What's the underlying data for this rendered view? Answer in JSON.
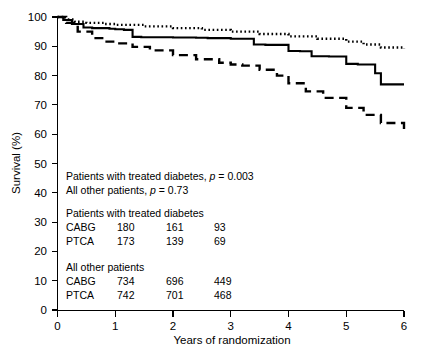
{
  "chart_data": {
    "type": "line",
    "title": "",
    "xlabel": "Years of randomization",
    "ylabel": "Survival (%)",
    "xlim": [
      0,
      6
    ],
    "ylim": [
      0,
      100
    ],
    "grid": false,
    "legend_position": "none",
    "xticks": [
      "0",
      "1",
      "2",
      "3",
      "4",
      "5",
      "6"
    ],
    "yticks": [
      "0",
      "10",
      "20",
      "30",
      "40",
      "50",
      "60",
      "70",
      "80",
      "90",
      "100"
    ],
    "series": [
      {
        "name": "All other patients, CABG",
        "style": "dotted",
        "x": [
          0,
          0.12,
          0.3,
          0.5,
          0.8,
          1.0,
          1.5,
          2.0,
          2.5,
          3.0,
          3.5,
          4.0,
          4.5,
          5.0,
          5.3,
          5.6,
          6.0
        ],
        "values": [
          100,
          99.2,
          98.4,
          98.0,
          97.6,
          97.3,
          96.8,
          96.2,
          95.6,
          95.0,
          94.2,
          93.4,
          92.6,
          91.6,
          90.6,
          89.6,
          89.2
        ]
      },
      {
        "name": "Patients with treated diabetes, CABG",
        "style": "solid",
        "x": [
          0,
          0.1,
          0.25,
          0.45,
          0.6,
          0.75,
          0.9,
          1.0,
          1.15,
          1.3,
          1.45,
          2.0,
          2.4,
          2.6,
          3.0,
          3.4,
          3.6,
          4.0,
          4.2,
          4.4,
          4.7,
          5.0,
          5.2,
          5.5,
          5.6,
          6.0
        ],
        "values": [
          100,
          99.0,
          97.6,
          96.4,
          96.2,
          96.2,
          96.0,
          95.8,
          95.6,
          93.2,
          93.1,
          93.0,
          92.9,
          92.8,
          92.6,
          90.6,
          90.5,
          88.4,
          88.3,
          86.6,
          86.5,
          84.0,
          83.8,
          80.8,
          77.0,
          77.0
        ]
      },
      {
        "name": "Patients with treated diabetes, PTCA",
        "style": "dashed",
        "x": [
          0,
          0.15,
          0.35,
          0.6,
          0.85,
          1.0,
          1.3,
          1.6,
          2.0,
          2.4,
          2.8,
          3.0,
          3.2,
          3.5,
          3.8,
          4.0,
          4.3,
          4.6,
          5.0,
          5.3,
          5.6,
          6.0
        ],
        "values": [
          100,
          98.0,
          95.0,
          92.8,
          91.6,
          91.0,
          89.8,
          88.6,
          87.0,
          85.6,
          84.4,
          83.8,
          83.4,
          82.0,
          80.0,
          77.4,
          74.6,
          72.4,
          69.0,
          66.6,
          63.8,
          61.0
        ]
      }
    ],
    "annotations": {
      "pvalues": [
        {
          "label": "Patients with treated diabetes,",
          "stat": "p",
          "eq": "= 0.003"
        },
        {
          "label": "All other patients,",
          "stat": "p",
          "eq": "= 0.73"
        }
      ],
      "tables": [
        {
          "heading": "Patients with treated diabetes",
          "rows": [
            {
              "arm": "CABG",
              "counts": [
                "180",
                "161",
                "93"
              ]
            },
            {
              "arm": "PTCA",
              "counts": [
                "173",
                "139",
                "69"
              ]
            }
          ]
        },
        {
          "heading": "All other patients",
          "rows": [
            {
              "arm": "CABG",
              "counts": [
                "734",
                "696",
                "449"
              ]
            },
            {
              "arm": "PTCA",
              "counts": [
                "742",
                "701",
                "468"
              ]
            }
          ]
        }
      ]
    }
  }
}
